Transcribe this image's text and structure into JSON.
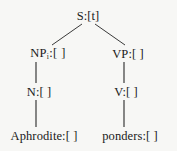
{
  "diagram": {
    "kind": "syntax-parse-tree",
    "background_color": "#f7f7f5",
    "line_color": "#3a3a3a",
    "text_color": "#1a1a1a",
    "nodes": {
      "root": {
        "label": "S:[t]",
        "x": 88,
        "y": 16
      },
      "np": {
        "label": "NP",
        "subscript": "i",
        "suffix": ":[ ]",
        "x": 48,
        "y": 54
      },
      "vp": {
        "label": "VP:[ ]",
        "x": 128,
        "y": 54
      },
      "n": {
        "label": "N:[ ]",
        "x": 39,
        "y": 92
      },
      "v": {
        "label": "V:[ ]",
        "x": 126,
        "y": 92
      },
      "term_left": {
        "label": "Aphrodite:[ ]",
        "x": 44,
        "y": 136
      },
      "term_right": {
        "label": "ponders:[ ]",
        "x": 130,
        "y": 136
      }
    },
    "edges": [
      {
        "name": "s-to-np",
        "x1": 82,
        "y1": 24,
        "x2": 52,
        "y2": 45
      },
      {
        "name": "s-to-vp",
        "x1": 95,
        "y1": 24,
        "x2": 125,
        "y2": 45
      },
      {
        "name": "np-to-n",
        "x1": 36,
        "y1": 62,
        "x2": 36,
        "y2": 83
      },
      {
        "name": "vp-to-v",
        "x1": 124,
        "y1": 62,
        "x2": 124,
        "y2": 83
      },
      {
        "name": "n-to-aphrodite",
        "x1": 36,
        "y1": 100,
        "x2": 36,
        "y2": 127
      },
      {
        "name": "v-to-ponders",
        "x1": 124,
        "y1": 100,
        "x2": 124,
        "y2": 127
      }
    ]
  }
}
